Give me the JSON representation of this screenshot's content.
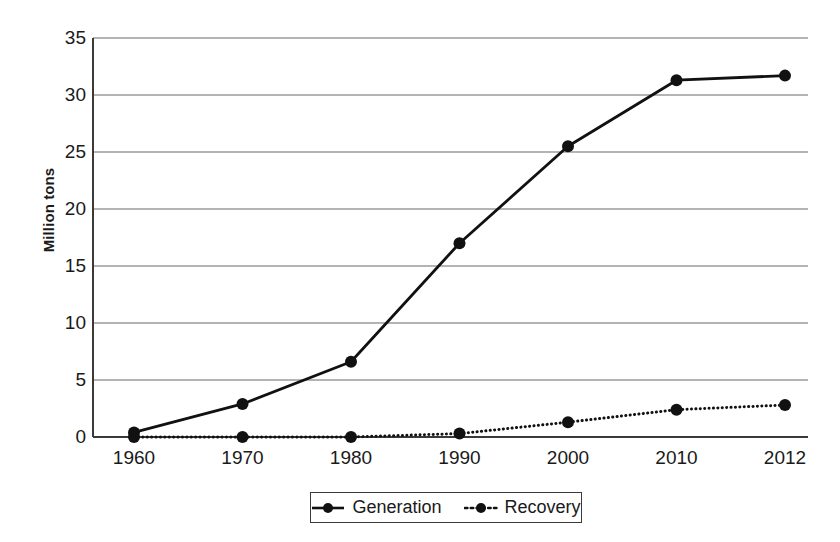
{
  "chart_data": {
    "type": "line",
    "title": "",
    "xlabel": "",
    "ylabel": "Million tons",
    "categories": [
      "1960",
      "1970",
      "1980",
      "1990",
      "2000",
      "2010",
      "2012"
    ],
    "ylim": [
      0,
      35
    ],
    "ytick_step": 5,
    "yticks": [
      "0",
      "5",
      "10",
      "15",
      "20",
      "25",
      "30",
      "35"
    ],
    "grid": "horizontal",
    "legend_position": "bottom-center",
    "series": [
      {
        "name": "Generation",
        "line_style": "solid",
        "marker": "circle",
        "color": "#111111",
        "values": [
          0.4,
          2.9,
          6.6,
          17.0,
          25.5,
          31.3,
          31.7
        ]
      },
      {
        "name": "Recovery",
        "line_style": "dotted",
        "marker": "circle",
        "color": "#111111",
        "values": [
          0.0,
          0.0,
          0.0,
          0.3,
          1.3,
          2.4,
          2.8
        ]
      }
    ]
  },
  "legend": {
    "entries": [
      {
        "label": "Generation",
        "style": "solid"
      },
      {
        "label": "Recovery",
        "style": "dotted"
      }
    ]
  },
  "colors": {
    "series": "#111111",
    "grid": "#6b6b6b",
    "axis": "#3a3a3a",
    "text": "#1a1a1a",
    "background": "#ffffff"
  }
}
